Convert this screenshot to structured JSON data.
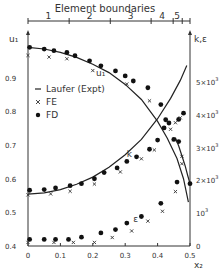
{
  "chart_data": {
    "type": "scatter",
    "title": "",
    "top_axis": {
      "label": "Element boundaries",
      "ticks_x": [
        0.0,
        0.127,
        0.254,
        0.38,
        0.448,
        0.476
      ],
      "element_labels": [
        "1",
        "2",
        "3",
        "4",
        "5"
      ],
      "element_label_x": [
        0.063,
        0.19,
        0.317,
        0.414,
        0.46
      ]
    },
    "xlabel": "x₂",
    "xlim": [
      0,
      0.5
    ],
    "xticks": [
      "0",
      "0.1",
      "0.2",
      "0.3",
      "0.4",
      "0.5"
    ],
    "left_axis": {
      "label": "u₁",
      "ylim": [
        0.4,
        1.0
      ],
      "ticks": [
        {
          "v": 0.9,
          "label": "0.9"
        },
        {
          "v": 0.8,
          "label": "0.8"
        },
        {
          "v": 0.7,
          "label": "0.7"
        },
        {
          "v": 0.6,
          "label": "0.6"
        },
        {
          "v": 0.5,
          "label": "0.5"
        },
        {
          "v": 0.4,
          "label": "0.4"
        }
      ]
    },
    "right_axis": {
      "label": "k,ε",
      "ylim": [
        0,
        6000
      ],
      "ticks": [
        {
          "v": 5,
          "label": "5×10³"
        },
        {
          "v": 4,
          "label": "4×10³"
        },
        {
          "v": 3,
          "label": "3×10³"
        },
        {
          "v": 2,
          "label": "2×10³"
        },
        {
          "v": 1,
          "label": "10³"
        },
        {
          "v": 0,
          "label": "0"
        }
      ]
    },
    "legend": [
      {
        "symbol": "—",
        "label": "Laufer (Expt)"
      },
      {
        "symbol": "×",
        "label": "FE"
      },
      {
        "symbol": "●",
        "label": "FD"
      }
    ],
    "curve_labels": [
      {
        "text": "u₁",
        "x": 0.21,
        "y_px": 76
      },
      {
        "text": "k",
        "x": 0.305,
        "y_px": 157
      },
      {
        "text": "ε",
        "x": 0.325,
        "y_px": 222
      }
    ],
    "series": [
      {
        "name": "Laufer (Expt) u1",
        "kind": "line",
        "axis": "left",
        "x": [
          0.0,
          0.05,
          0.1,
          0.15,
          0.2,
          0.25,
          0.3,
          0.35,
          0.4,
          0.43,
          0.46,
          0.48,
          0.495
        ],
        "y": [
          0.99,
          0.985,
          0.975,
          0.96,
          0.94,
          0.915,
          0.88,
          0.835,
          0.77,
          0.72,
          0.66,
          0.6,
          0.53
        ]
      },
      {
        "name": "FD u1",
        "kind": "dot",
        "axis": "left",
        "x": [
          0.005,
          0.05,
          0.08,
          0.12,
          0.145,
          0.19,
          0.225,
          0.27,
          0.3,
          0.325,
          0.37,
          0.41,
          0.425,
          0.465
        ],
        "y": [
          0.99,
          0.985,
          0.98,
          0.975,
          0.965,
          0.95,
          0.935,
          0.92,
          0.905,
          0.89,
          0.87,
          0.82,
          0.775,
          0.71
        ]
      },
      {
        "name": "FE u1",
        "kind": "cross",
        "axis": "left",
        "x": [
          0.0,
          0.065,
          0.12,
          0.2,
          0.305,
          0.375,
          0.45,
          0.475
        ],
        "y": [
          0.975,
          0.97,
          0.965,
          0.93,
          0.89,
          0.84,
          0.725,
          0.675
        ]
      },
      {
        "name": "Laufer (Expt) k",
        "kind": "line",
        "axis": "right",
        "x": [
          0.0,
          0.05,
          0.1,
          0.15,
          0.2,
          0.25,
          0.3,
          0.35,
          0.4,
          0.44,
          0.47,
          0.49
        ],
        "y": [
          1.58,
          1.62,
          1.72,
          1.88,
          2.1,
          2.4,
          2.78,
          3.25,
          3.88,
          4.5,
          5.05,
          5.5
        ]
      },
      {
        "name": "FD k",
        "kind": "dot",
        "axis": "right",
        "x": [
          0.005,
          0.05,
          0.085,
          0.13,
          0.165,
          0.205,
          0.235,
          0.275,
          0.305,
          0.335,
          0.375,
          0.4,
          0.42,
          0.435,
          0.465,
          0.48
        ],
        "y": [
          1.7,
          1.72,
          1.77,
          1.84,
          1.9,
          2.05,
          2.24,
          2.38,
          2.58,
          2.72,
          2.95,
          3.23,
          3.6,
          3.75,
          3.86,
          4.05
        ]
      },
      {
        "name": "FE k",
        "kind": "cross",
        "axis": "right",
        "x": [
          0.0,
          0.07,
          0.13,
          0.205,
          0.285,
          0.35,
          0.39,
          0.44,
          0.455,
          0.47
        ],
        "y": [
          1.65,
          1.68,
          1.76,
          1.98,
          2.35,
          2.75,
          3.02,
          3.65,
          3.85,
          4.0
        ]
      },
      {
        "name": "Laufer (Expt) ε",
        "kind": "line",
        "axis": "right",
        "x": [
          0.455,
          0.465,
          0.475,
          0.485,
          0.493,
          0.5
        ],
        "y": [
          3.3,
          3.05,
          2.75,
          2.45,
          2.15,
          1.9
        ]
      },
      {
        "name": "FD ε",
        "kind": "dot",
        "axis": "right",
        "x": [
          0.005,
          0.05,
          0.085,
          0.125,
          0.165,
          0.225,
          0.27,
          0.305,
          0.35,
          0.41,
          0.45,
          0.46,
          0.5
        ],
        "y": [
          0.2,
          0.2,
          0.2,
          0.2,
          0.27,
          0.4,
          0.5,
          0.7,
          0.9,
          1.3,
          3.25,
          1.95,
          1.9
        ]
      },
      {
        "name": "FE ε",
        "kind": "cross",
        "axis": "right",
        "x": [
          0.0,
          0.08,
          0.14,
          0.205,
          0.26,
          0.32,
          0.37,
          0.415,
          0.455,
          0.475
        ],
        "y": [
          0.2,
          0.2,
          0.2,
          0.2,
          0.35,
          0.55,
          0.85,
          1.15,
          1.75,
          2.6
        ]
      }
    ]
  }
}
